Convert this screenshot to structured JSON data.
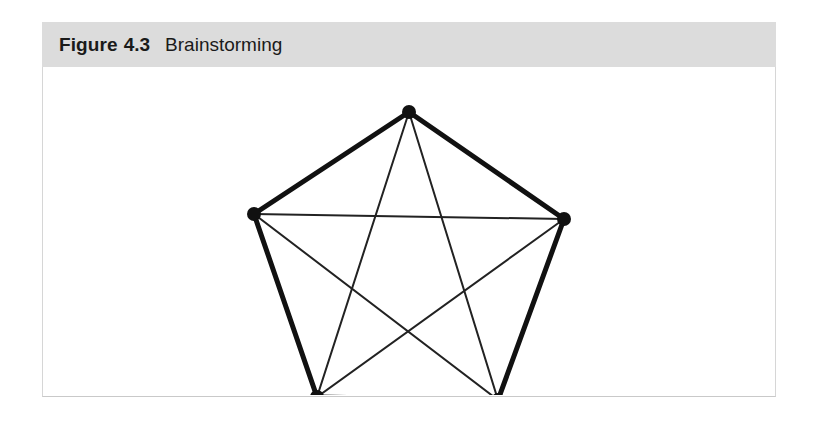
{
  "figure": {
    "label": "Figure",
    "number": "4.3",
    "caption": "Brainstorming",
    "header_background": "#dcdcdc",
    "body_background": "#ffffff",
    "border_color": "#d6d6d6",
    "text_color": "#1a1a1a"
  },
  "chart_data": {
    "type": "diagram",
    "diagram_kind": "complete-graph",
    "title": "Brainstorming",
    "node_count": 5,
    "edge_count": 10,
    "node_color": "#111111",
    "node_radius": 7,
    "perimeter_edge_color": "#111111",
    "perimeter_edge_width": 5,
    "diagonal_edge_color": "#222222",
    "diagonal_edge_width": 2,
    "nodes": [
      {
        "id": "n1",
        "label": "",
        "x": 366,
        "y": 45
      },
      {
        "id": "n2",
        "label": "",
        "x": 211,
        "y": 147
      },
      {
        "id": "n3",
        "label": "",
        "x": 521,
        "y": 152
      },
      {
        "id": "n4",
        "label": "",
        "x": 274,
        "y": 330
      },
      {
        "id": "n5",
        "label": "",
        "x": 455,
        "y": 333
      }
    ],
    "perimeter_edges": [
      {
        "from": "n1",
        "to": "n2"
      },
      {
        "from": "n1",
        "to": "n3"
      },
      {
        "from": "n2",
        "to": "n4"
      },
      {
        "from": "n3",
        "to": "n5"
      },
      {
        "from": "n4",
        "to": "n5"
      }
    ],
    "diagonal_edges": [
      {
        "from": "n1",
        "to": "n4"
      },
      {
        "from": "n1",
        "to": "n5"
      },
      {
        "from": "n2",
        "to": "n3"
      },
      {
        "from": "n2",
        "to": "n5"
      },
      {
        "from": "n3",
        "to": "n4"
      }
    ]
  }
}
